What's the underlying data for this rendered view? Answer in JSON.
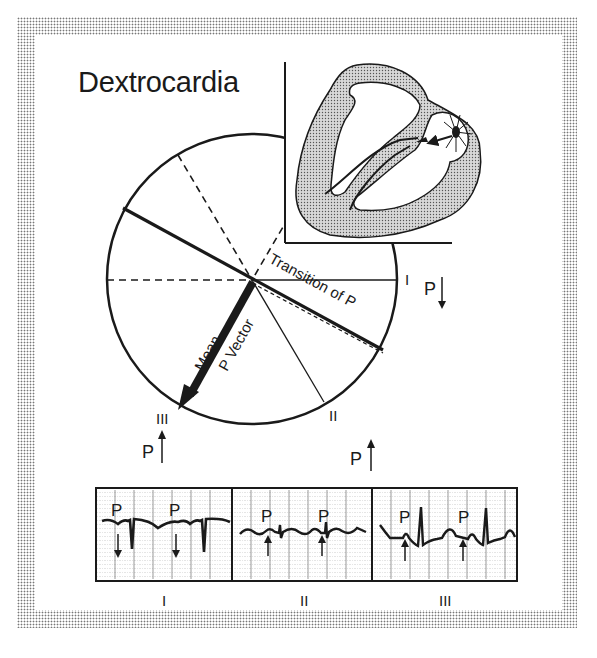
{
  "title": "Dextrocardia",
  "hexaxial": {
    "transition_label": "Transition of P",
    "mean_vector_label_line1": "Mean",
    "mean_vector_label_line2": "P Vector",
    "lead_labels": {
      "I": "I",
      "II": "II",
      "III": "III"
    },
    "p_indicators": [
      {
        "lead": "I",
        "label": "P",
        "direction": "down"
      },
      {
        "lead": "II",
        "label": "P",
        "direction": "up"
      },
      {
        "lead": "III",
        "label": "P",
        "direction": "up"
      }
    ]
  },
  "heart_inset": {
    "description": "Heart cross-section with right-sided pacemaker origin"
  },
  "ecg_strips": [
    {
      "lead": "I",
      "p_label": "P",
      "p_direction": "down",
      "p_count": 2
    },
    {
      "lead": "II",
      "p_label": "P",
      "p_direction": "up",
      "p_count": 2
    },
    {
      "lead": "III",
      "p_label": "P",
      "p_direction": "up",
      "p_count": 2
    }
  ],
  "colors": {
    "ink": "#1a1a1a",
    "stipple": "#777777",
    "background": "#ffffff"
  }
}
